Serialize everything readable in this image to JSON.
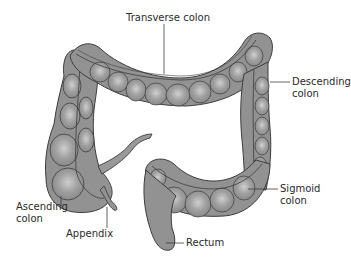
{
  "diagram": {
    "colors": {
      "tissue_fill": "#8f8f8f",
      "tissue_highlight": "#c4c4c4",
      "outline": "#3c3c3c",
      "leader_line": "#3c3c3c",
      "label_text": "#2a2a2a",
      "background": "#ffffff"
    },
    "labels": {
      "transverse": "Transverse colon",
      "descending_1": "Descending",
      "descending_2": "colon",
      "ascending_1": "Ascending",
      "ascending_2": "colon",
      "appendix": "Appendix",
      "sigmoid_1": "Sigmoid",
      "sigmoid_2": "colon",
      "rectum": "Rectum"
    }
  }
}
